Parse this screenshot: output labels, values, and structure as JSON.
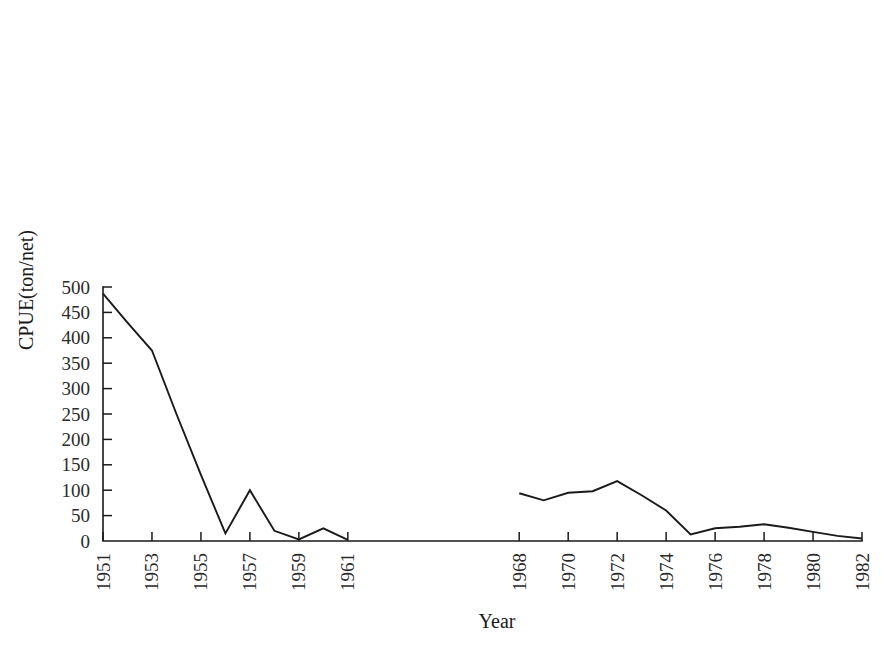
{
  "chart_data": {
    "type": "line",
    "title": "",
    "subtitle": "",
    "xlabel": "Year",
    "ylabel": "CPUE(ton/net)",
    "xlim": [
      1951,
      1982
    ],
    "ylim": [
      0,
      500
    ],
    "grid": false,
    "legend": "none",
    "y_ticks": [
      0,
      50,
      100,
      150,
      200,
      250,
      300,
      350,
      400,
      450,
      500
    ],
    "y_tick_labels": [
      "0",
      "50",
      "100",
      "150",
      "200",
      "250",
      "300",
      "350",
      "400",
      "450",
      "500"
    ],
    "x_ticks": [
      1951,
      1953,
      1955,
      1957,
      1959,
      1961,
      1968,
      1970,
      1972,
      1974,
      1976,
      1978,
      1980,
      1982
    ],
    "x_tick_labels": [
      "1951",
      "1953",
      "1955",
      "1957",
      "1959",
      "1961",
      "1968",
      "1970",
      "1972",
      "1974",
      "1976",
      "1978",
      "1980",
      "1982"
    ],
    "x_tick_rotation": 90,
    "line_color": "#1a1a1a",
    "series": [
      {
        "name": "CPUE",
        "segments": [
          {
            "label": "1951-1961",
            "x": [
              1951,
              1952,
              1953,
              1954,
              1955,
              1956,
              1957,
              1958,
              1959,
              1960,
              1961
            ],
            "y": [
              487,
              430,
              375,
              250,
              130,
              15,
              100,
              20,
              3,
              25,
              2
            ]
          },
          {
            "label": "1968-1982",
            "x": [
              1968,
              1969,
              1970,
              1971,
              1972,
              1973,
              1974,
              1975,
              1976,
              1977,
              1978,
              1979,
              1980,
              1981,
              1982
            ],
            "y": [
              94,
              80,
              95,
              98,
              118,
              90,
              60,
              13,
              25,
              28,
              33,
              26,
              18,
              10,
              5
            ]
          }
        ]
      }
    ],
    "gap_note": "No data between 1961 and 1968"
  },
  "axes": {
    "y_axis_name": "y-axis",
    "x_axis_name": "x-axis"
  }
}
